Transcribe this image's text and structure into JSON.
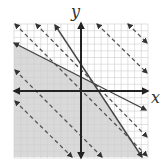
{
  "diagram": {
    "type": "linear-inequality-graph",
    "axes": {
      "x_label": "x",
      "y_label": "y",
      "x_range": [
        -10,
        10
      ],
      "y_range": [
        -10,
        10
      ],
      "grid": true
    },
    "colors": {
      "grid": "#cfcfcf",
      "axis": "#222222",
      "solid_line": "#444444",
      "dashed_line": "#555555",
      "shaded_region": "#d9d9d9",
      "background": "#ffffff"
    },
    "solid_lines": [
      {
        "name": "boundary-line-shallow",
        "from_px": [
          14,
          43
        ],
        "to_px": [
          146,
          110
        ]
      },
      {
        "name": "boundary-line-steep",
        "from_px": [
          55,
          25
        ],
        "to_px": [
          142,
          157
        ]
      }
    ],
    "dashed_lines": [
      {
        "name": "objective-line-1",
        "from_px": [
          15,
          24
        ],
        "to_px": [
          147,
          156
        ]
      },
      {
        "name": "objective-line-2",
        "from_px": [
          36,
          24
        ],
        "to_px": [
          147,
          137
        ]
      },
      {
        "name": "objective-line-3",
        "from_px": [
          97,
          24
        ],
        "to_px": [
          147,
          73
        ]
      },
      {
        "name": "objective-line-4",
        "from_px": [
          128,
          24
        ],
        "to_px": [
          147,
          43
        ]
      },
      {
        "name": "objective-line-5",
        "from_px": [
          15,
          70
        ],
        "to_px": [
          102,
          157
        ]
      },
      {
        "name": "objective-line-6",
        "from_px": [
          15,
          101
        ],
        "to_px": [
          72,
          157
        ]
      }
    ],
    "shaded_region_px": [
      [
        14,
        24
      ],
      [
        14,
        43
      ],
      [
        93,
        83
      ],
      [
        142,
        157
      ],
      [
        14,
        157
      ]
    ]
  }
}
